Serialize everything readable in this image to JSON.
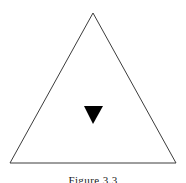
{
  "figure": {
    "caption": "Figure 3.3",
    "background_color": "#ffffff",
    "outline_color": "#3c3c3c",
    "marker_color": "#000000",
    "outer_triangle": {
      "shape_name": "equilateral-triangle-outline",
      "orientation": "point-up",
      "apex": {
        "x": 93,
        "y": 13
      },
      "bottom_left": {
        "x": 10,
        "y": 163
      },
      "bottom_right": {
        "x": 176,
        "y": 163
      },
      "stroke_width": 1,
      "fill": "none"
    },
    "inner_marker": {
      "shape_name": "filled-triangle-marker",
      "orientation": "point-down",
      "top_left": {
        "x": 84,
        "y": 106
      },
      "top_right": {
        "x": 103,
        "y": 106
      },
      "apex": {
        "x": 93,
        "y": 124
      },
      "fill": "#000000"
    }
  },
  "icons": {
    "triangle_outline": "triangle-outline-icon",
    "triangle_down_filled": "triangle-down-filled-icon"
  }
}
